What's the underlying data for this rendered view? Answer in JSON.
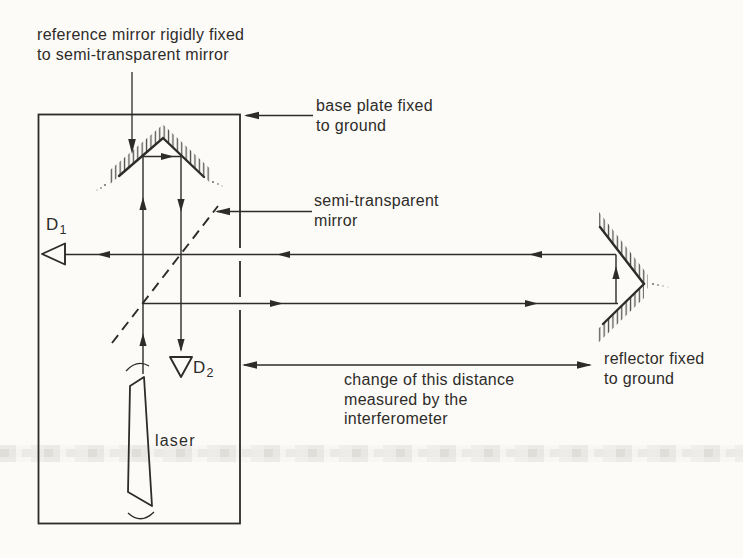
{
  "figure": {
    "labels": {
      "reference_mirror": "reference mirror rigidly fixed\nto semi-transparent mirror",
      "base_plate": "base plate fixed\nto ground",
      "semi_transparent_mirror": "semi-transparent\nmirror",
      "reflector": "reflector fixed\nto ground",
      "measured_distance": "change of this distance\nmeasured by the\ninterferometer",
      "laser": "laser"
    },
    "detectors": {
      "d1": {
        "main": "D",
        "sub": "1"
      },
      "d2": {
        "main": "D",
        "sub": "2"
      }
    },
    "colors": {
      "ink": "#2e2c29",
      "paper": "#fcfbf8",
      "scan_band": "#74706a"
    }
  }
}
